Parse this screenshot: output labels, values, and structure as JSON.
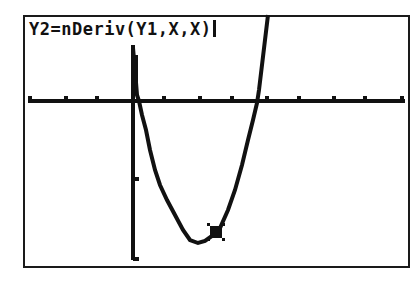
{
  "screen": {
    "equation_text": "Y2=nDeriv(Y1,X,X)",
    "text_cursor": "|"
  },
  "graph": {
    "colors": {
      "ink": "#111111",
      "background": "#ffffff",
      "frame": "#1a1a1a"
    },
    "x_axis_y": 101,
    "y_axis_x": 133,
    "x_ticks": [
      30,
      66,
      97,
      164,
      200,
      232,
      267,
      299,
      334,
      365,
      402
    ],
    "y_ticks": [
      179,
      259
    ],
    "curve_points": "133,48 135,70 137,95 139,101 142,115 146,130 150,150 155,170 160,185 167,200 175,215 183,230 190,240 198,243 205,241 212,236 220,228 228,210 235,190 242,165 248,140 253,120 257,103 259,90 262,65 265,40 268,15",
    "trace_cursor": {
      "x": 216,
      "y": 232
    }
  }
}
